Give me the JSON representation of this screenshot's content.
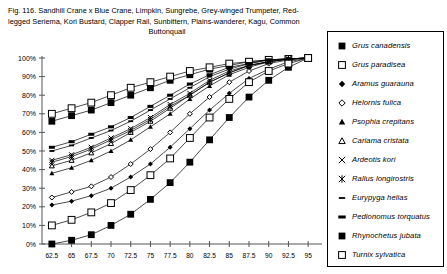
{
  "caption": {
    "lines": [
      "Fig. 116.  Sandhill Crane x Blue Crane, Limpkin, Sungrebe, Grey-winged Trumpeter, Red-",
      "legged Seriema, Kori Bustard, Clapper Rail, Sunbittern, Plains-wanderer, Kagu, Common",
      "Buttonquail"
    ],
    "line3_centered": true
  },
  "legend": {
    "position": "right",
    "border_color": "#000000",
    "entries": [
      {
        "label": "Grus canadensis",
        "marker": "filled-square"
      },
      {
        "label": "Grus paradisea",
        "marker": "open-square"
      },
      {
        "label": "Aramus guarauna",
        "marker": "filled-diamond"
      },
      {
        "label": "Helornis fulica",
        "marker": "open-diamond"
      },
      {
        "label": "Psophia crepitans",
        "marker": "filled-triangle"
      },
      {
        "label": "Cariama cristata",
        "marker": "open-triangle"
      },
      {
        "label": "Ardeotis kori",
        "marker": "cross-x"
      },
      {
        "label": "Rallus longirostris",
        "marker": "asterisk"
      },
      {
        "label": "Eurypyga helias",
        "marker": "short-dash"
      },
      {
        "label": "Pedionomus torquatus",
        "marker": "thick-dash"
      },
      {
        "label": "Rhynochetus jubata",
        "marker": "filled-square"
      },
      {
        "label": "Turnix sylvatica",
        "marker": "open-square"
      }
    ]
  },
  "chart_data": {
    "type": "line",
    "title": "",
    "xlabel": "",
    "ylabel": "",
    "xlim": [
      61.25,
      96.25
    ],
    "ylim": [
      0,
      100
    ],
    "grid": false,
    "legend_position": "right",
    "x": [
      62.5,
      65,
      67.5,
      70,
      72.5,
      75,
      77.5,
      80,
      82.5,
      85,
      87.5,
      90,
      92.5,
      95
    ],
    "xticklabels": [
      "62.5",
      "65",
      "67.5",
      "70",
      "72.5",
      "75",
      "77.5",
      "80",
      "82.5",
      "85",
      "87.5",
      "90",
      "92.5",
      "95"
    ],
    "yticklabels": [
      "0%",
      "10%",
      "20%",
      "30%",
      "40%",
      "50%",
      "60%",
      "70%",
      "80%",
      "90%",
      "100%"
    ],
    "yticks": [
      0,
      10,
      20,
      30,
      40,
      50,
      60,
      70,
      80,
      90,
      100
    ],
    "series": [
      {
        "name": "Grus canadensis",
        "marker": "filled-square",
        "values": [
          66,
          69,
          72,
          76,
          80,
          84,
          88,
          91,
          94,
          96,
          98,
          99,
          99.5,
          100
        ]
      },
      {
        "name": "Grus paradisea",
        "marker": "open-square",
        "values": [
          70,
          73,
          76,
          80,
          84,
          87,
          90,
          93,
          95,
          97,
          98,
          99,
          99.5,
          100
        ]
      },
      {
        "name": "Aramus guarauna",
        "marker": "filled-diamond",
        "values": [
          21,
          23,
          26,
          30,
          36,
          43,
          52,
          62,
          72,
          81,
          89,
          94,
          98,
          100
        ]
      },
      {
        "name": "Helornis fulica",
        "marker": "open-diamond",
        "values": [
          25,
          28,
          31,
          36,
          43,
          51,
          60,
          70,
          79,
          87,
          93,
          97,
          99,
          100
        ]
      },
      {
        "name": "Psophia crepitans",
        "marker": "filled-triangle",
        "values": [
          38,
          41,
          45,
          50,
          56,
          63,
          70,
          78,
          85,
          91,
          95,
          98,
          99.5,
          100
        ]
      },
      {
        "name": "Cariama cristata",
        "marker": "open-triangle",
        "values": [
          42,
          45,
          49,
          54,
          60,
          66,
          73,
          80,
          87,
          92,
          96,
          98,
          99.5,
          100
        ]
      },
      {
        "name": "Ardeotis kori",
        "marker": "cross-x",
        "values": [
          45,
          48,
          52,
          57,
          62,
          68,
          75,
          81,
          88,
          93,
          96,
          98,
          99.5,
          100
        ]
      },
      {
        "name": "Rallus longirostris",
        "marker": "asterisk",
        "values": [
          44,
          47,
          51,
          56,
          61,
          67,
          74,
          80,
          87,
          92,
          96,
          98,
          99.5,
          100
        ]
      },
      {
        "name": "Eurypyga helias",
        "marker": "short-dash",
        "values": [
          50,
          53,
          57,
          61,
          66,
          72,
          78,
          84,
          90,
          94,
          97,
          99,
          99.5,
          100
        ]
      },
      {
        "name": "Pedionomus torquatus",
        "marker": "thick-dash",
        "values": [
          52,
          55,
          59,
          63,
          68,
          74,
          80,
          86,
          91,
          95,
          97,
          99,
          99.5,
          100
        ]
      },
      {
        "name": "Rhynochetus jubata",
        "marker": "filled-square",
        "values": [
          0,
          2,
          5,
          10,
          16,
          24,
          33,
          44,
          56,
          68,
          79,
          88,
          95,
          100
        ]
      },
      {
        "name": "Turnix sylvatica",
        "marker": "open-square",
        "values": [
          10,
          13,
          17,
          22,
          29,
          37,
          46,
          57,
          68,
          78,
          87,
          93,
          97,
          100
        ]
      }
    ]
  }
}
